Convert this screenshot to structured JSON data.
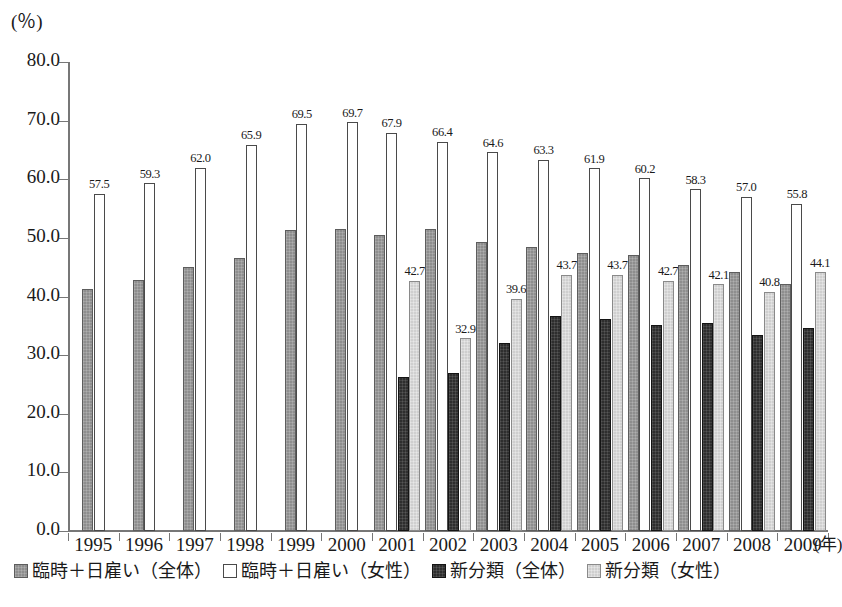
{
  "chart_data": {
    "type": "bar",
    "title": "",
    "xlabel": "年",
    "ylabel": "(%)",
    "ylim": [
      0,
      80
    ],
    "ytick_step": 10,
    "ytick_labels": [
      "0.0",
      "10.0",
      "20.0",
      "30.0",
      "40.0",
      "50.0",
      "60.0",
      "70.0",
      "80.0"
    ],
    "grid": false,
    "legend_position": "bottom",
    "categories": [
      "1995",
      "1996",
      "1997",
      "1998",
      "1999",
      "2000",
      "2001",
      "2002",
      "2003",
      "2004",
      "2005",
      "2006",
      "2007",
      "2008",
      "2009"
    ],
    "series": [
      {
        "name": "臨時＋日雇い（全体）",
        "style": "medium-gray-hatch",
        "color": "#8e8e8e",
        "labels_shown": false,
        "values": [
          41.3,
          42.8,
          45.1,
          46.5,
          51.3,
          51.6,
          50.5,
          51.5,
          49.3,
          48.5,
          47.5,
          47.0,
          45.3,
          44.2,
          42.1
        ]
      },
      {
        "name": "臨時＋日雇い（女性）",
        "style": "open-white",
        "color": "#ffffff",
        "labels_shown": true,
        "values": [
          57.5,
          59.3,
          62.0,
          65.9,
          69.5,
          69.7,
          67.9,
          66.4,
          64.6,
          63.3,
          61.9,
          60.2,
          58.3,
          57.0,
          55.8
        ],
        "value_labels": [
          "57.5",
          "59.3",
          "62.0",
          "65.9",
          "69.5",
          "69.7",
          "67.9",
          "66.4",
          "64.6",
          "63.3",
          "61.9",
          "60.2",
          "58.3",
          "57.0",
          "55.8"
        ]
      },
      {
        "name": "新分類（全体）",
        "style": "dark",
        "color": "#2e2e2e",
        "labels_shown": false,
        "values": [
          null,
          null,
          null,
          null,
          null,
          null,
          26.2,
          27.0,
          32.1,
          36.7,
          36.2,
          35.2,
          35.4,
          33.5,
          34.6
        ]
      },
      {
        "name": "新分類（女性）",
        "style": "light-gray",
        "color": "#cfcfcf",
        "labels_shown": true,
        "values": [
          null,
          null,
          null,
          null,
          null,
          null,
          42.7,
          32.9,
          39.6,
          43.7,
          43.7,
          42.7,
          42.1,
          40.8,
          44.1
        ],
        "value_labels": [
          null,
          null,
          null,
          null,
          null,
          null,
          "42.7",
          "32.9",
          "39.6",
          "43.7",
          "43.7",
          "42.7",
          "42.1",
          "40.8",
          "44.1"
        ]
      }
    ]
  },
  "axis": {
    "unit_label": "(％)",
    "x_unit_label": "(年)"
  },
  "legend": {
    "items": [
      {
        "label": "臨時＋日雇い（全体）",
        "swatch": "medium-gray-hatch"
      },
      {
        "label": "臨時＋日雇い（女性）",
        "swatch": "open-white"
      },
      {
        "label": "新分類（全体）",
        "swatch": "dark"
      },
      {
        "label": "新分類（女性）",
        "swatch": "light-gray"
      }
    ]
  },
  "caption": {
    "text": ""
  }
}
